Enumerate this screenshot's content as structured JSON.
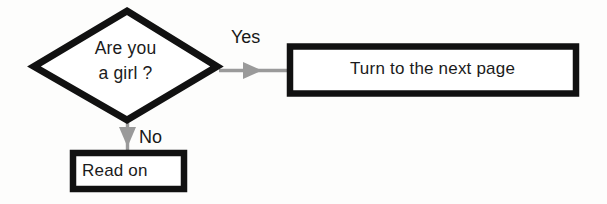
{
  "diagram": {
    "background_color": "#fdfdfc",
    "shape_border_color": "#111111",
    "shape_fill_color": "#ffffff",
    "arrow_color": "#9a9a9a",
    "text_color": "#1b1b1b",
    "nodes": {
      "decision": {
        "shape": "diamond",
        "line1": "Are you",
        "line2": "a girl ?",
        "text": "Are you\na girl ?"
      },
      "process_next_page": {
        "shape": "rectangle",
        "text": "Turn to the next page"
      },
      "process_read_on": {
        "shape": "rectangle",
        "text": "Read on"
      }
    },
    "edges": {
      "yes": {
        "label": "Yes",
        "from": "decision",
        "to": "process_next_page",
        "direction": "right"
      },
      "no": {
        "label": "No",
        "from": "decision",
        "to": "process_read_on",
        "direction": "down"
      }
    }
  }
}
